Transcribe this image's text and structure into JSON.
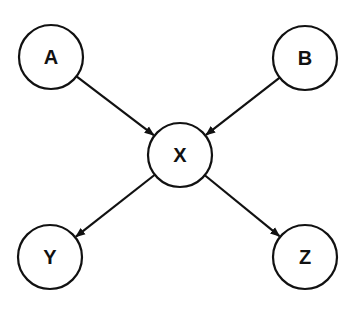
{
  "diagram": {
    "type": "directed-graph",
    "nodes": [
      {
        "id": "A",
        "label": "A",
        "cx": 51,
        "cy": 57
      },
      {
        "id": "B",
        "label": "B",
        "cx": 305,
        "cy": 58
      },
      {
        "id": "X",
        "label": "X",
        "cx": 180,
        "cy": 155
      },
      {
        "id": "Y",
        "label": "Y",
        "cx": 50,
        "cy": 257
      },
      {
        "id": "Z",
        "label": "Z",
        "cx": 305,
        "cy": 257
      }
    ],
    "edges": [
      {
        "from": "A",
        "to": "X"
      },
      {
        "from": "B",
        "to": "X"
      },
      {
        "from": "X",
        "to": "Y"
      },
      {
        "from": "X",
        "to": "Z"
      }
    ],
    "node_radius": 32,
    "stroke_color": "#111111"
  }
}
